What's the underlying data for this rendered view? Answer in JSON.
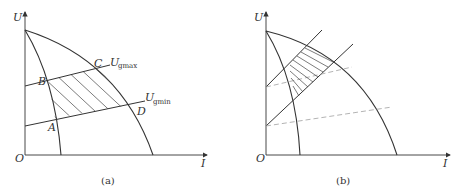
{
  "panels": [
    {
      "caption": "(a)",
      "axis_y_label": "U",
      "axis_x_label": "I",
      "origin_label": "O",
      "points": {
        "A": "A",
        "B": "B",
        "C": "C",
        "D": "D"
      },
      "lines": {
        "upper": {
          "label": "U",
          "subscript": "gmax"
        },
        "lower": {
          "label": "U",
          "subscript": "gmin"
        }
      },
      "hatched_region": "ABCD"
    },
    {
      "caption": "(b)",
      "axis_y_label": "U",
      "axis_x_label": "I",
      "origin_label": "O",
      "dashed_lines": 2,
      "hatched_region": "shifted operating region"
    }
  ],
  "colors": {
    "stroke": "#333333",
    "dashed": "#aaaaaa",
    "hatch": "#444444"
  }
}
